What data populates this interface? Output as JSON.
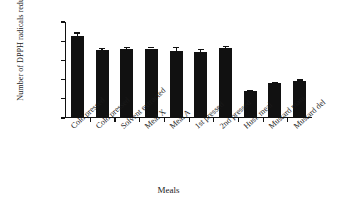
{
  "chart_data": {
    "type": "bar",
    "title": "",
    "xlabel": "Meals",
    "ylabel": "Number of DPPH radicals reduced (10",
    "ylabel_exponent": "18",
    "ylabel_close": ")",
    "categories": [
      "Cold pressed",
      "Cold pressed",
      "Solvent extracted",
      "Meal X",
      "Meal A",
      "1st pressed",
      "2nd pressed",
      "Husk meal",
      "Mustard mani",
      "Mustard del"
    ],
    "values": [
      21.4,
      17.8,
      18.0,
      18.1,
      17.4,
      17.2,
      18.2,
      7.0,
      9.0,
      9.7
    ],
    "errors": [
      0.9,
      0.4,
      0.5,
      0.4,
      1.1,
      0.8,
      0.5,
      0.2,
      0.5,
      0.4
    ],
    "ylim": [
      0,
      25
    ],
    "yticks": [
      "25",
      "20",
      "15",
      "10",
      "5",
      "0"
    ],
    "ytickvalues": [
      25,
      20,
      15,
      10,
      5,
      0
    ],
    "grid": false,
    "legend": "none",
    "bar_color": "#111111",
    "background_color": "#ffffff"
  }
}
